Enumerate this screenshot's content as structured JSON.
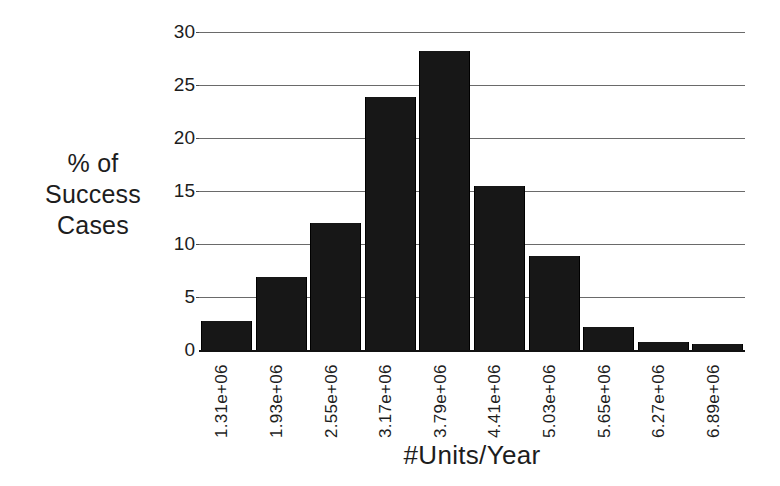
{
  "chart_data": {
    "type": "bar",
    "title": "",
    "xlabel": "#Units/Year",
    "ylabel": "% of Success Cases",
    "ylabel_lines": [
      "% of",
      "Success",
      "Cases"
    ],
    "categories": [
      "1.31e+06",
      "1.93e+06",
      "2.55e+06",
      "3.17e+06",
      "3.79e+06",
      "4.41e+06",
      "5.03e+06",
      "5.65e+06",
      "6.27e+06",
      "6.89e+06"
    ],
    "values": [
      2.7,
      6.9,
      12.0,
      23.9,
      28.2,
      15.5,
      8.9,
      2.2,
      0.8,
      0.6
    ],
    "ylim": [
      0,
      30
    ],
    "yticks": [
      0,
      5,
      10,
      15,
      20,
      25,
      30
    ],
    "ytick_labels": [
      "0",
      "5",
      "10",
      "15",
      "20",
      "25",
      "30"
    ],
    "grid": true,
    "legend": "none",
    "bar_color": "#171717",
    "grid_color": "#6a6a6a",
    "axis_color": "#111111",
    "background": "#ffffff"
  }
}
